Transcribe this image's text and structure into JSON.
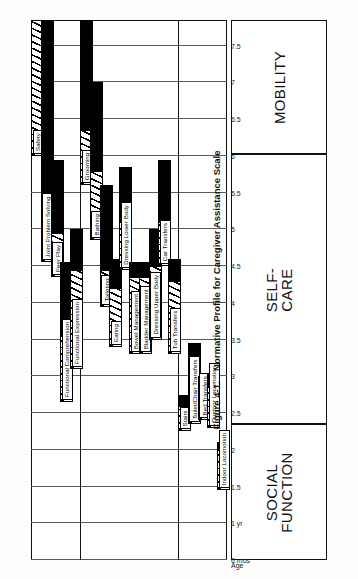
{
  "figure": {
    "caption_number": "Figure 4-1.",
    "caption_title": "Normative Profile for Caregiver Assistance Scale"
  },
  "axis": {
    "name": "Age",
    "ticks": [
      "6 mos",
      "1 yr",
      "1.5",
      "2",
      "2.5",
      "3",
      "3.5",
      "4",
      "4.5",
      "5",
      "5.5",
      "6",
      "6.5",
      "7",
      "7.5"
    ],
    "tick_values": [
      0.5,
      1,
      1.5,
      2,
      2.5,
      3,
      3.5,
      4,
      4.5,
      5,
      5.5,
      6,
      6.5,
      7,
      7.5
    ],
    "min": 0.5,
    "max": 7.85
  },
  "groups": [
    {
      "id": "social-function",
      "label": "SOCIAL\nFUNCTION"
    },
    {
      "id": "self-care",
      "label": "SELF-\nCARE"
    },
    {
      "id": "mobility",
      "label": "MOBILITY"
    }
  ],
  "legend": {
    "hatch_meaning": "hatched",
    "solid_meaning": "solid"
  },
  "chart_data": {
    "type": "bar",
    "title": "Normative Profile for Caregiver Assistance Scale",
    "xlabel": "Age",
    "ylabel": "",
    "xlim": [
      0.5,
      7.85
    ],
    "grid": true,
    "orientation": "horizontal-rotated",
    "legend_position": "none",
    "categories": [
      "Safety",
      "Joint Problem Solving",
      "Peer Play",
      "Functional Comprehension",
      "Functional Expression",
      "Grooming",
      "Bathing",
      "Toileting",
      "Eating",
      "Dressing Lower Body",
      "Bowel Management",
      "Bladder Management",
      "Dressing Upper Body",
      "Car Transfers",
      "Tub Transfers",
      "Stairs",
      "Toilet/Chair Transfers",
      "Bed Transfers",
      "Outdoor Locomotion",
      "Indoor Locomotion"
    ],
    "series": [
      {
        "name": "hatched",
        "values": [
          [
            6.0,
            7.85
          ],
          [
            4.55,
            5.35
          ],
          [
            4.35,
            4.95
          ],
          [
            2.65,
            3.55
          ],
          [
            3.1,
            4.45
          ],
          [
            5.6,
            6.35
          ],
          [
            4.85,
            5.8
          ],
          [
            3.95,
            4.45
          ],
          [
            3.4,
            4.2
          ],
          [
            4.45,
            5.1
          ],
          [
            3.3,
            4.35
          ],
          [
            3.3,
            4.35
          ],
          [
            3.5,
            4.5
          ],
          [
            4.5,
            5.1
          ],
          [
            3.3,
            4.3
          ],
          [
            2.25,
            2.6
          ],
          [
            2.35,
            2.75
          ],
          [
            2.4,
            2.8
          ],
          [
            2.3,
            2.85
          ],
          [
            1.45,
            2.0
          ]
        ]
      },
      {
        "name": "solid",
        "values": [
          [
            null,
            null
          ],
          [
            5.35,
            7.85
          ],
          [
            4.95,
            5.95
          ],
          [
            3.55,
            4.55
          ],
          [
            4.45,
            5.0
          ],
          [
            6.35,
            7.85
          ],
          [
            5.8,
            7.0
          ],
          [
            4.45,
            5.6
          ],
          [
            4.2,
            4.6
          ],
          [
            5.1,
            5.85
          ],
          [
            4.35,
            4.55
          ],
          [
            4.35,
            4.55
          ],
          [
            4.5,
            5.0
          ],
          [
            5.1,
            5.95
          ],
          [
            4.3,
            4.6
          ],
          [
            2.6,
            2.75
          ],
          [
            2.75,
            3.45
          ],
          [
            2.8,
            3.0
          ],
          [
            2.85,
            3.05
          ],
          [
            2.0,
            2.1
          ]
        ]
      }
    ],
    "group_membership": [
      "social-function",
      "social-function",
      "social-function",
      "social-function",
      "social-function",
      "self-care",
      "self-care",
      "self-care",
      "self-care",
      "self-care",
      "self-care",
      "self-care",
      "self-care",
      "self-care",
      "self-care",
      "mobility",
      "mobility",
      "mobility",
      "mobility",
      "mobility"
    ]
  }
}
